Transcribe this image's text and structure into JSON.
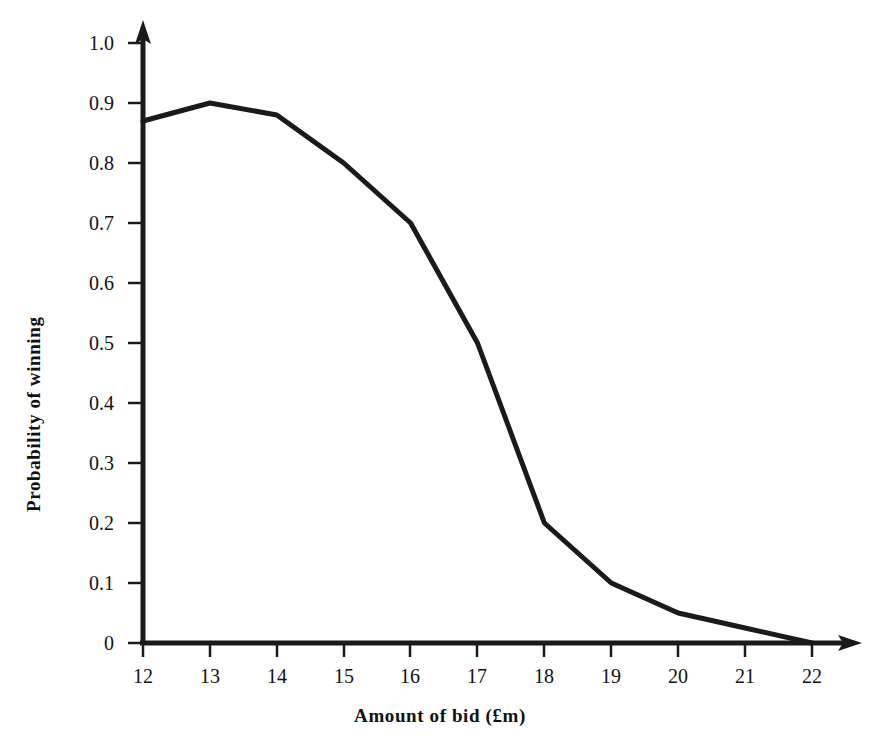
{
  "chart_data": {
    "type": "line",
    "title": "",
    "subtitle": "",
    "xlabel": "Amount of bid (£m)",
    "ylabel": "Probability of winning",
    "x": [
      12,
      13,
      14,
      15,
      16,
      17,
      18,
      19,
      20,
      21,
      22
    ],
    "values": [
      0.87,
      0.9,
      0.88,
      0.8,
      0.7,
      0.5,
      0.2,
      0.1,
      0.05,
      0.025,
      0.0
    ],
    "series": [
      {
        "name": "Probability of winning",
        "values": [
          0.87,
          0.9,
          0.88,
          0.8,
          0.7,
          0.5,
          0.2,
          0.1,
          0.05,
          0.025,
          0.0
        ]
      }
    ],
    "xlim": [
      12,
      22
    ],
    "ylim": [
      0,
      1.0
    ],
    "xticks": [
      12,
      13,
      14,
      15,
      16,
      17,
      18,
      19,
      20,
      21,
      22
    ],
    "yticks": [
      0,
      0.1,
      0.2,
      0.3,
      0.4,
      0.5,
      0.6,
      0.7,
      0.8,
      0.9,
      1.0
    ],
    "xtick_labels": [
      "12",
      "13",
      "14",
      "15",
      "16",
      "17",
      "18",
      "19",
      "20",
      "21",
      "22"
    ],
    "ytick_labels": [
      "0",
      "0.1",
      "0.2",
      "0.3",
      "0.4",
      "0.5",
      "0.6",
      "0.7",
      "0.8",
      "0.9",
      "1.0"
    ],
    "grid": false,
    "legend": false,
    "legend_position": "none",
    "annotations": [],
    "line_color": "#1a1a1a",
    "line_width": 5,
    "axis_color": "#1a1a1a",
    "background_color": "#ffffff"
  },
  "axes": {
    "y_title": "Probability of winning",
    "x_title": "Amount of bid (£m)",
    "y_tick_labels": [
      "1.0",
      "0.9",
      "0.8",
      "0.7",
      "0.6",
      "0.5",
      "0.4",
      "0.3",
      "0.2",
      "0.1",
      "0"
    ],
    "x_tick_labels": [
      "12",
      "13",
      "14",
      "15",
      "16",
      "17",
      "18",
      "19",
      "20",
      "21",
      "22"
    ],
    "y_arrow": "arrow-up-icon",
    "x_arrow": "arrow-right-icon"
  }
}
